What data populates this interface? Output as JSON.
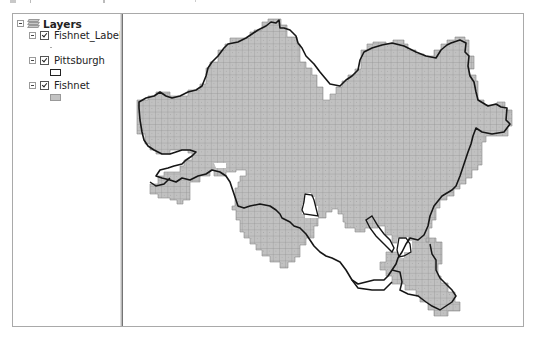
{
  "toc": {
    "root": {
      "label": "Layers",
      "icon": "layers-icon",
      "expanded": true
    },
    "layers": [
      {
        "label": "Fishnet_Label",
        "checked": true,
        "expanded": true,
        "symbol": "point-symbol"
      },
      {
        "label": "Pittsburgh",
        "checked": true,
        "expanded": true,
        "symbol": "polygon-outline-symbol"
      },
      {
        "label": "Fishnet",
        "checked": true,
        "expanded": true,
        "symbol": "polygon-fill-symbol"
      }
    ]
  },
  "map": {
    "features": [
      "Fishnet grid cells",
      "Pittsburgh boundary",
      "Fishnet label points"
    ],
    "colors": {
      "fishnet_fill": "#c0c0c0",
      "fishnet_stroke": "#8c8c8c",
      "boundary_stroke": "#1a1a1a",
      "background": "#ffffff"
    }
  }
}
